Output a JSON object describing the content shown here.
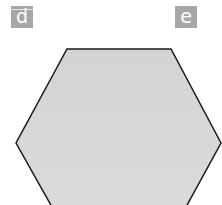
{
  "labels": [
    {
      "id": "d",
      "text": "d"
    },
    {
      "id": "e",
      "text": "e"
    }
  ],
  "shape": {
    "type": "hexagon",
    "fill": "#d6d6d6",
    "stroke": "#1a1a1a",
    "label_box_color": "#a7a7a7"
  }
}
